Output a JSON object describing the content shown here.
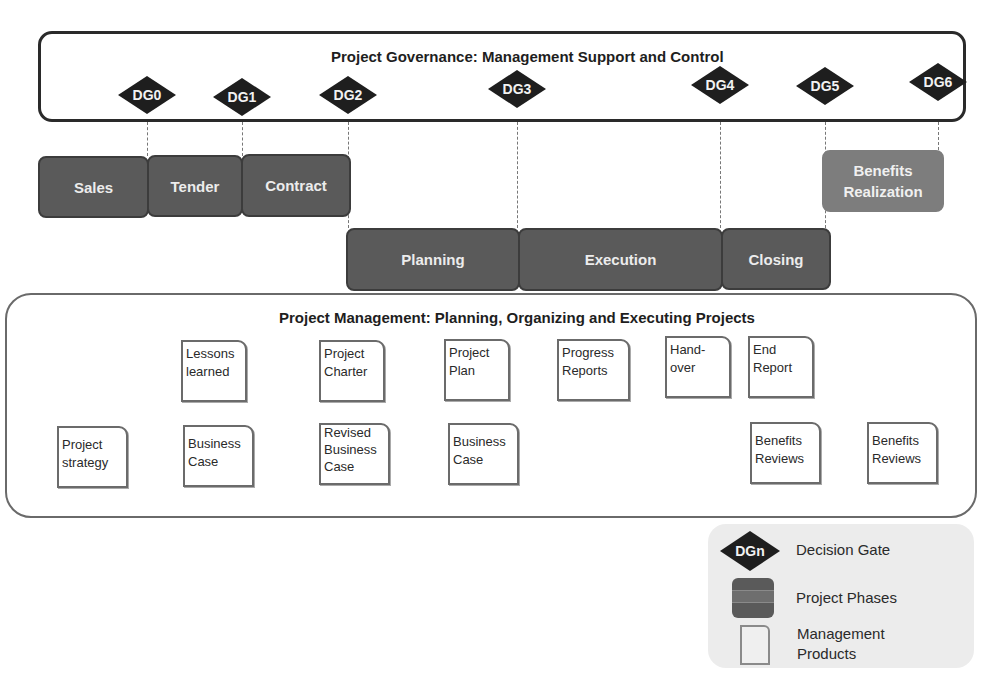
{
  "governance": {
    "title": "Project Governance: Management Support and Control",
    "gates": [
      {
        "label": "DG0",
        "x": 147
      },
      {
        "label": "DG1",
        "x": 242
      },
      {
        "label": "DG2",
        "x": 348
      },
      {
        "label": "DG3",
        "x": 517
      },
      {
        "label": "DG4",
        "x": 720
      },
      {
        "label": "DG5",
        "x": 825
      },
      {
        "label": "DG6",
        "x": 938
      }
    ]
  },
  "phases": {
    "sales": "Sales",
    "tender": "Tender",
    "contract": "Contract",
    "planning": "Planning",
    "execution": "Execution",
    "closing": "Closing",
    "benefits_realization_1": "Benefits",
    "benefits_realization_2": "Realization"
  },
  "management": {
    "title": "Project Management: Planning, Organizing and Executing Projects",
    "products": {
      "lessons_learned": [
        "Lessons",
        "learned"
      ],
      "project_charter": [
        "Project",
        "Charter"
      ],
      "project_plan": [
        "Project",
        "Plan"
      ],
      "progress_reports": [
        "Progress",
        "Reports"
      ],
      "hand_over": [
        "Hand-",
        "over"
      ],
      "end_report": [
        "End",
        "Report"
      ],
      "project_strategy": [
        "Project",
        "strategy"
      ],
      "business_case_1": [
        "Business",
        "Case"
      ],
      "revised_business_case": [
        "Revised",
        "Business",
        "Case"
      ],
      "business_case_2": [
        "Business",
        "Case"
      ],
      "benefits_reviews_1": [
        "Benefits",
        "Reviews"
      ],
      "benefits_reviews_2": [
        "Benefits",
        "Reviews"
      ]
    }
  },
  "legend": {
    "gate_symbol": "DGn",
    "decision_gate": "Decision Gate",
    "project_phases": "Project Phases",
    "management_products_1": "Management",
    "management_products_2": "Products"
  },
  "colors": {
    "phase_dark": "#5a5a5a",
    "phase_light": "#7d7d7d",
    "gate_fill": "#1e1e1e",
    "legend_bg": "#ececec"
  }
}
